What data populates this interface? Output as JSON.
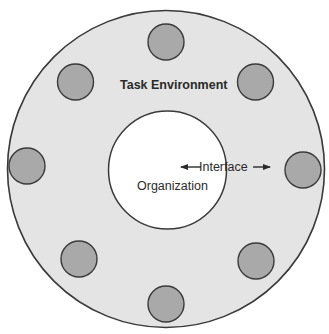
{
  "diagram": {
    "type": "concentric-environment-diagram",
    "outer_circle": {
      "label": "Task Environment",
      "fill": "#e4e4e4",
      "stroke": "#3a3a3a"
    },
    "inner_circle": {
      "label": "Organization",
      "fill": "#ffffff",
      "stroke": "#3a3a3a"
    },
    "interface_label": "Interface",
    "elements": {
      "count": 8,
      "fill": "#a9a9a9",
      "stroke": "#3a3a3a",
      "positions": [
        "top",
        "top-right",
        "right",
        "bottom-right",
        "bottom",
        "bottom-left",
        "left",
        "top-left"
      ]
    }
  }
}
